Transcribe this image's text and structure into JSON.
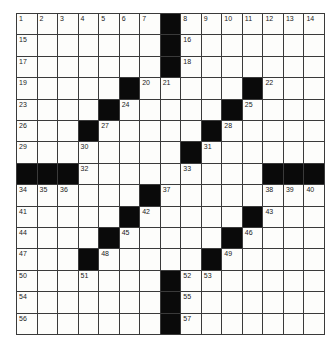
{
  "puzzle": {
    "size": 15,
    "rows": [
      "#######.#######",
      "#######.#######",
      "#######.#######",
      "#####.#####.###",
      "####.#####.####",
      "###.#####.#####",
      "########.######",
      "...#########...",
      "######.########",
      "#####.#####.###",
      "####.#####.####",
      "###.#####.#####",
      "#######.#######",
      "#######.#######",
      "#######.#######"
    ],
    "legend": "# = white cell, . = black block",
    "numbers": [
      {
        "r": 0,
        "c": 0,
        "n": "1"
      },
      {
        "r": 0,
        "c": 1,
        "n": "2"
      },
      {
        "r": 0,
        "c": 2,
        "n": "3"
      },
      {
        "r": 0,
        "c": 3,
        "n": "4"
      },
      {
        "r": 0,
        "c": 4,
        "n": "5"
      },
      {
        "r": 0,
        "c": 5,
        "n": "6"
      },
      {
        "r": 0,
        "c": 6,
        "n": "7"
      },
      {
        "r": 0,
        "c": 8,
        "n": "8"
      },
      {
        "r": 0,
        "c": 9,
        "n": "9"
      },
      {
        "r": 0,
        "c": 10,
        "n": "10"
      },
      {
        "r": 0,
        "c": 11,
        "n": "11"
      },
      {
        "r": 0,
        "c": 12,
        "n": "12"
      },
      {
        "r": 0,
        "c": 13,
        "n": "13"
      },
      {
        "r": 0,
        "c": 14,
        "n": "14"
      },
      {
        "r": 1,
        "c": 0,
        "n": "15"
      },
      {
        "r": 1,
        "c": 8,
        "n": "16"
      },
      {
        "r": 2,
        "c": 0,
        "n": "17"
      },
      {
        "r": 2,
        "c": 8,
        "n": "18"
      },
      {
        "r": 3,
        "c": 0,
        "n": "19"
      },
      {
        "r": 3,
        "c": 6,
        "n": "20"
      },
      {
        "r": 3,
        "c": 7,
        "n": "21"
      },
      {
        "r": 3,
        "c": 12,
        "n": "22"
      },
      {
        "r": 4,
        "c": 0,
        "n": "23"
      },
      {
        "r": 4,
        "c": 5,
        "n": "24"
      },
      {
        "r": 4,
        "c": 11,
        "n": "25"
      },
      {
        "r": 5,
        "c": 0,
        "n": "26"
      },
      {
        "r": 5,
        "c": 4,
        "n": "27"
      },
      {
        "r": 5,
        "c": 10,
        "n": "28"
      },
      {
        "r": 6,
        "c": 0,
        "n": "29"
      },
      {
        "r": 6,
        "c": 3,
        "n": "30"
      },
      {
        "r": 6,
        "c": 9,
        "n": "31"
      },
      {
        "r": 7,
        "c": 3,
        "n": "32"
      },
      {
        "r": 7,
        "c": 8,
        "n": "33"
      },
      {
        "r": 8,
        "c": 0,
        "n": "34"
      },
      {
        "r": 8,
        "c": 1,
        "n": "35"
      },
      {
        "r": 8,
        "c": 2,
        "n": "36"
      },
      {
        "r": 8,
        "c": 7,
        "n": "37"
      },
      {
        "r": 8,
        "c": 12,
        "n": "38"
      },
      {
        "r": 8,
        "c": 13,
        "n": "39"
      },
      {
        "r": 8,
        "c": 14,
        "n": "40"
      },
      {
        "r": 9,
        "c": 0,
        "n": "41"
      },
      {
        "r": 9,
        "c": 6,
        "n": "42"
      },
      {
        "r": 9,
        "c": 12,
        "n": "43"
      },
      {
        "r": 10,
        "c": 0,
        "n": "44"
      },
      {
        "r": 10,
        "c": 5,
        "n": "45"
      },
      {
        "r": 10,
        "c": 11,
        "n": "46"
      },
      {
        "r": 11,
        "c": 0,
        "n": "47"
      },
      {
        "r": 11,
        "c": 4,
        "n": "48"
      },
      {
        "r": 11,
        "c": 10,
        "n": "49"
      },
      {
        "r": 12,
        "c": 0,
        "n": "50"
      },
      {
        "r": 12,
        "c": 3,
        "n": "51"
      },
      {
        "r": 12,
        "c": 8,
        "n": "52"
      },
      {
        "r": 12,
        "c": 9,
        "n": "53"
      },
      {
        "r": 13,
        "c": 0,
        "n": "54"
      },
      {
        "r": 13,
        "c": 8,
        "n": "55"
      },
      {
        "r": 14,
        "c": 0,
        "n": "56"
      },
      {
        "r": 14,
        "c": 8,
        "n": "57"
      }
    ]
  },
  "colors": {
    "block": "#0a0a0a",
    "cell": "#fdfdfb",
    "gridline": "#3a3a3a"
  }
}
